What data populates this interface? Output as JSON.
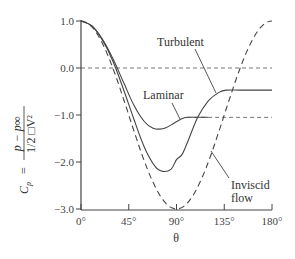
{
  "chart_data": {
    "type": "line",
    "title": "",
    "xlabel": "θ",
    "ylabel": "C_p = (p − p∞) / (1/2 □V²)",
    "ylabel_parts": {
      "lhs": "C",
      "lhs_sub": "p",
      "eq": "=",
      "num": "p − p∞",
      "den": "1/2 □V²"
    },
    "xlim": [
      0,
      180
    ],
    "ylim": [
      -3.0,
      1.0
    ],
    "x_ticks": [
      0,
      45,
      90,
      135,
      180
    ],
    "x_tick_labels": [
      "0°",
      "45°",
      "90°",
      "135°",
      "180°"
    ],
    "y_ticks": [
      1.0,
      0.0,
      -1.0,
      -2.0,
      -3.0
    ],
    "y_tick_labels": [
      "1.0",
      "0.0",
      "−1.0",
      "−2.0",
      "−3.0"
    ],
    "grid": false,
    "reference_lines": [
      {
        "name": "Cp = 0",
        "y": 0.0,
        "style": "dashed"
      },
      {
        "name": "Laminar plateau",
        "y": -1.05,
        "style": "dashed",
        "x_from": 100
      }
    ],
    "series": [
      {
        "name": "Inviscid flow",
        "style": "dashed",
        "formula": "1 - 4 sin^2(theta)",
        "x": [
          0,
          15,
          30,
          45,
          60,
          75,
          90,
          105,
          120,
          135,
          150,
          165,
          180
        ],
        "values": [
          1.0,
          0.73,
          0.0,
          -1.0,
          -2.0,
          -2.73,
          -3.0,
          -2.73,
          -2.0,
          -1.0,
          0.0,
          0.73,
          1.0
        ]
      },
      {
        "name": "Turbulent",
        "style": "solid",
        "x": [
          0,
          10,
          20,
          30,
          40,
          50,
          60,
          70,
          77,
          85,
          90,
          95,
          100,
          110,
          120,
          130,
          137,
          150,
          165,
          180
        ],
        "values": [
          1.0,
          0.9,
          0.6,
          0.15,
          -0.45,
          -1.1,
          -1.7,
          -2.1,
          -2.2,
          -2.15,
          -1.95,
          -1.85,
          -1.6,
          -1.05,
          -0.7,
          -0.52,
          -0.47,
          -0.47,
          -0.47,
          -0.47
        ]
      },
      {
        "name": "Laminar",
        "style": "solid",
        "x": [
          0,
          10,
          20,
          30,
          40,
          50,
          60,
          68,
          74,
          80,
          88,
          95,
          100,
          110,
          120
        ],
        "values": [
          1.0,
          0.9,
          0.62,
          0.2,
          -0.3,
          -0.8,
          -1.15,
          -1.28,
          -1.3,
          -1.27,
          -1.17,
          -1.08,
          -1.05,
          -1.05,
          -1.05
        ]
      }
    ],
    "annotations": [
      {
        "text": "Turbulent",
        "points_to": "Turbulent curve near θ≈127°"
      },
      {
        "text": "Laminar",
        "points_to": "Laminar curve near θ≈93°"
      },
      {
        "text": "Inviscid",
        "line2": "flow",
        "points_to": "Inviscid curve near θ≈123°"
      }
    ],
    "legend": "none (inline annotations)"
  },
  "labels": {
    "turbulent": "Turbulent",
    "laminar": "Laminar",
    "inviscid_1": "Inviscid",
    "inviscid_2": "flow",
    "xlabel": "θ",
    "ylabel_lhs": "C",
    "ylabel_sub": "p",
    "ylabel_eq": "=",
    "ylabel_num": "p − p∞",
    "ylabel_den": "1/2 □V²"
  },
  "colors": {
    "axis": "#444444",
    "curve": "#444444",
    "dashed_ref": "#666666"
  }
}
